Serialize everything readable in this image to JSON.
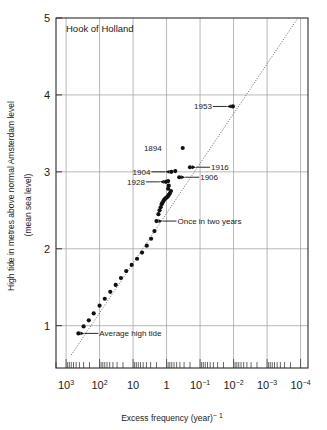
{
  "figure": {
    "top_fragment": "",
    "plot_title": "Hook of Holland"
  },
  "axes": {
    "x": {
      "title": "Excess frequency (year)",
      "title_exponent": "− 1",
      "tick_labels": [
        {
          "mantissa": "10",
          "exponent": "3",
          "value": 1000
        },
        {
          "mantissa": "10",
          "exponent": "2",
          "value": 100
        },
        {
          "mantissa": "10",
          "exponent": "",
          "value": 10
        },
        {
          "mantissa": "1",
          "exponent": "",
          "value": 1
        },
        {
          "mantissa": "10",
          "exponent": "-1",
          "value": 0.1
        },
        {
          "mantissa": "10",
          "exponent": "-2",
          "value": 0.01
        },
        {
          "mantissa": "10",
          "exponent": "-3",
          "value": 0.001
        },
        {
          "mantissa": "10",
          "exponent": "-4",
          "value": 0.0001
        }
      ]
    },
    "y": {
      "title_line1": "High tide in metres above normal Amsterdam level",
      "title_line2": "(mean sea level)",
      "tick_labels": [
        "1",
        "2",
        "3",
        "4",
        "5"
      ]
    }
  },
  "annotations": [
    {
      "label": "1953",
      "x": 0.0105,
      "y": 3.85,
      "side": "left"
    },
    {
      "label": "1894",
      "x": 0.33,
      "y": 3.31,
      "side": "left",
      "no_arrow": true
    },
    {
      "label": "1904",
      "x": 0.72,
      "y": 3.0,
      "side": "left"
    },
    {
      "label": "1916",
      "x": 0.2,
      "y": 3.06,
      "side": "right"
    },
    {
      "label": "1928",
      "x": 1.05,
      "y": 2.87,
      "side": "left"
    },
    {
      "label": "1906",
      "x": 0.42,
      "y": 2.93,
      "side": "right"
    },
    {
      "label": "Once in two years",
      "x": 2.0,
      "y": 2.36,
      "side": "right"
    },
    {
      "label": "Average high tide",
      "x": 430.0,
      "y": 0.9,
      "side": "right"
    }
  ],
  "chart_data": {
    "type": "scatter",
    "title": "Hook of Holland",
    "xlabel": "Excess frequency (year)^-1",
    "ylabel": "High tide in metres above normal Amsterdam level (mean sea level)",
    "xscale": "log",
    "x_reversed": true,
    "xlim": [
      2000,
      6e-05
    ],
    "ylim": [
      0.45,
      5.0
    ],
    "grid": true,
    "legend": "none",
    "x_tick_values": [
      1000,
      100,
      10,
      1,
      0.1,
      0.01,
      0.001,
      0.0001
    ],
    "y_tick_values": [
      1,
      2,
      3,
      4,
      5
    ],
    "points": [
      {
        "x": 430.0,
        "y": 0.9
      },
      {
        "x": 300.0,
        "y": 0.99
      },
      {
        "x": 210.0,
        "y": 1.07
      },
      {
        "x": 150.0,
        "y": 1.16
      },
      {
        "x": 100.0,
        "y": 1.26
      },
      {
        "x": 70.0,
        "y": 1.35
      },
      {
        "x": 48.0,
        "y": 1.44
      },
      {
        "x": 33.0,
        "y": 1.53
      },
      {
        "x": 23.0,
        "y": 1.62
      },
      {
        "x": 16.0,
        "y": 1.71
      },
      {
        "x": 11.0,
        "y": 1.79
      },
      {
        "x": 7.6,
        "y": 1.87
      },
      {
        "x": 5.4,
        "y": 1.95
      },
      {
        "x": 3.9,
        "y": 2.04
      },
      {
        "x": 2.9,
        "y": 2.13
      },
      {
        "x": 2.3,
        "y": 2.23
      },
      {
        "x": 2.0,
        "y": 2.36
      },
      {
        "x": 1.75,
        "y": 2.45
      },
      {
        "x": 1.62,
        "y": 2.5
      },
      {
        "x": 1.5,
        "y": 2.54
      },
      {
        "x": 1.4,
        "y": 2.58
      },
      {
        "x": 1.32,
        "y": 2.6
      },
      {
        "x": 1.24,
        "y": 2.62
      },
      {
        "x": 1.17,
        "y": 2.64
      },
      {
        "x": 1.1,
        "y": 2.65
      },
      {
        "x": 1.05,
        "y": 2.66
      },
      {
        "x": 0.98,
        "y": 2.67
      },
      {
        "x": 0.92,
        "y": 2.68
      },
      {
        "x": 0.86,
        "y": 2.7
      },
      {
        "x": 0.8,
        "y": 2.72
      },
      {
        "x": 0.74,
        "y": 2.75
      },
      {
        "x": 0.9,
        "y": 2.78
      },
      {
        "x": 0.86,
        "y": 2.82
      },
      {
        "x": 1.05,
        "y": 2.87
      },
      {
        "x": 0.9,
        "y": 2.88
      },
      {
        "x": 0.72,
        "y": 3.0
      },
      {
        "x": 0.55,
        "y": 3.01
      },
      {
        "x": 0.42,
        "y": 2.93
      },
      {
        "x": 0.2,
        "y": 3.06
      },
      {
        "x": 0.33,
        "y": 3.31
      },
      {
        "x": 0.0105,
        "y": 3.85
      }
    ],
    "fit_line": {
      "style": "dotted",
      "from": {
        "x": 700.0,
        "y": 0.62
      },
      "to": {
        "x": 0.00012,
        "y": 5.0
      }
    }
  }
}
